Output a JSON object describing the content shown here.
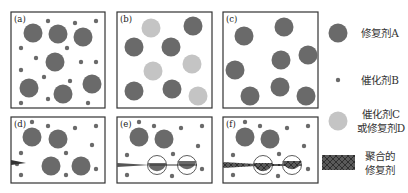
{
  "colors": {
    "healing_agent_a": "#6a6a6a",
    "catalyst_b": "#6a6a6a",
    "catalyst_c_or_agent_d": "#c4c4c4",
    "polymerized_agent": "#5a5a5a",
    "panel_border": "#333333"
  },
  "panels": [
    {
      "id": "a",
      "label": "(a)",
      "description": "Healing agent A capsules with dispersed catalyst B particles"
    },
    {
      "id": "b",
      "label": "(b)",
      "description": "Healing agent A capsules with catalyst C or healing agent D capsules"
    },
    {
      "id": "c",
      "label": "(c)",
      "description": "Healing agent A capsules only"
    },
    {
      "id": "d",
      "label": "(d)",
      "description": "Crack initiates at left edge"
    },
    {
      "id": "e",
      "label": "(e)",
      "description": "Crack propagates and ruptures capsules, releasing healing agent"
    },
    {
      "id": "f",
      "label": "(f)",
      "description": "Healing agent polymerizes filling the crack"
    }
  ],
  "legend": [
    {
      "label": "修复剂A",
      "symbol": "large-dark-circle"
    },
    {
      "label": "催化剂B",
      "symbol": "small-dark-dot"
    },
    {
      "label_line1": "催化剂C",
      "label_line2": "或修复剂D",
      "symbol": "large-light-circle"
    },
    {
      "label_line1": "聚合的",
      "label_line2": "修复剂",
      "symbol": "hatched-rectangle"
    }
  ]
}
